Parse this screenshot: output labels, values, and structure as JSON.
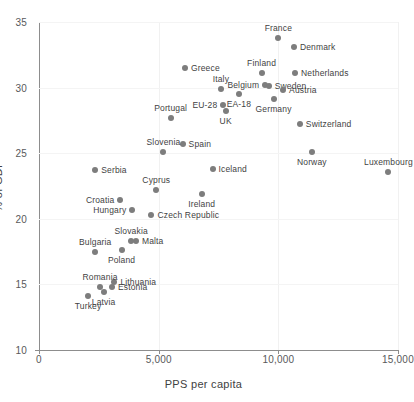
{
  "chart_data": {
    "type": "scatter",
    "title": "",
    "xlabel": "PPS per capita",
    "ylabel": "% of GDP",
    "xlim": [
      0,
      15000
    ],
    "ylim": [
      10,
      35
    ],
    "xticks": [
      0,
      5000,
      10000,
      15000
    ],
    "xtick_labels": [
      "0",
      "5,000",
      "10,000",
      "15,000"
    ],
    "yticks": [
      10,
      15,
      20,
      25,
      30,
      35
    ],
    "ytick_labels": [
      "10",
      "15",
      "20",
      "25",
      "30",
      "35"
    ],
    "grid": "light vertical and horizontal gridlines",
    "legend": "none",
    "marker_color": "#7d7d7d",
    "points": [
      {
        "label": "France",
        "x": 10000,
        "y": 33.8,
        "lpos": "t"
      },
      {
        "label": "Denmark",
        "x": 10650,
        "y": 33.1,
        "lpos": "r"
      },
      {
        "label": "Greece",
        "x": 6100,
        "y": 31.5,
        "lpos": "r"
      },
      {
        "label": "Finland",
        "x": 9300,
        "y": 31.1,
        "lpos": "t"
      },
      {
        "label": "Netherlands",
        "x": 10700,
        "y": 31.1,
        "lpos": "r"
      },
      {
        "label": "Belgium",
        "x": 9450,
        "y": 30.2,
        "lpos": "l"
      },
      {
        "label": "Sweden",
        "x": 9600,
        "y": 30.1,
        "lpos": "r"
      },
      {
        "label": "Italy",
        "x": 7600,
        "y": 29.9,
        "lpos": "t"
      },
      {
        "label": "Austria",
        "x": 10200,
        "y": 29.8,
        "lpos": "r"
      },
      {
        "label": "Germany",
        "x": 9800,
        "y": 29.1,
        "lpos": "b"
      },
      {
        "label": "EA-18",
        "x": 8350,
        "y": 29.5,
        "lpos": "b"
      },
      {
        "label": "EU-28",
        "x": 7700,
        "y": 28.7,
        "lpos": "l"
      },
      {
        "label": "UK",
        "x": 7800,
        "y": 28.2,
        "lpos": "b"
      },
      {
        "label": "Portugal",
        "x": 5500,
        "y": 27.7,
        "lpos": "t"
      },
      {
        "label": "Switzerland",
        "x": 10900,
        "y": 27.2,
        "lpos": "r"
      },
      {
        "label": "Spain",
        "x": 6000,
        "y": 25.7,
        "lpos": "r"
      },
      {
        "label": "Slovenia",
        "x": 5200,
        "y": 25.1,
        "lpos": "t"
      },
      {
        "label": "Norway",
        "x": 11400,
        "y": 25.1,
        "lpos": "b"
      },
      {
        "label": "Iceland",
        "x": 7250,
        "y": 23.8,
        "lpos": "r"
      },
      {
        "label": "Serbia",
        "x": 2350,
        "y": 23.7,
        "lpos": "r"
      },
      {
        "label": "Luxembourg",
        "x": 14600,
        "y": 23.6,
        "lpos": "t"
      },
      {
        "label": "Cyprus",
        "x": 4900,
        "y": 22.2,
        "lpos": "t"
      },
      {
        "label": "Ireland",
        "x": 6800,
        "y": 21.9,
        "lpos": "b"
      },
      {
        "label": "Croatia",
        "x": 3400,
        "y": 21.4,
        "lpos": "l"
      },
      {
        "label": "Hungary",
        "x": 3900,
        "y": 20.7,
        "lpos": "l"
      },
      {
        "label": "Czech Republic",
        "x": 4700,
        "y": 20.3,
        "lpos": "r"
      },
      {
        "label": "Slovakia",
        "x": 3850,
        "y": 18.3,
        "lpos": "t"
      },
      {
        "label": "Malta",
        "x": 4050,
        "y": 18.3,
        "lpos": "r"
      },
      {
        "label": "Poland",
        "x": 3450,
        "y": 17.6,
        "lpos": "b"
      },
      {
        "label": "Bulgaria",
        "x": 2350,
        "y": 17.5,
        "lpos": "t"
      },
      {
        "label": "Lithuania",
        "x": 3150,
        "y": 15.2,
        "lpos": "r"
      },
      {
        "label": "Romania",
        "x": 2550,
        "y": 14.8,
        "lpos": "t"
      },
      {
        "label": "Estonia",
        "x": 3050,
        "y": 14.8,
        "lpos": "r"
      },
      {
        "label": "Latvia",
        "x": 2700,
        "y": 14.4,
        "lpos": "b"
      },
      {
        "label": "Turkey",
        "x": 2050,
        "y": 14.1,
        "lpos": "b"
      }
    ]
  }
}
